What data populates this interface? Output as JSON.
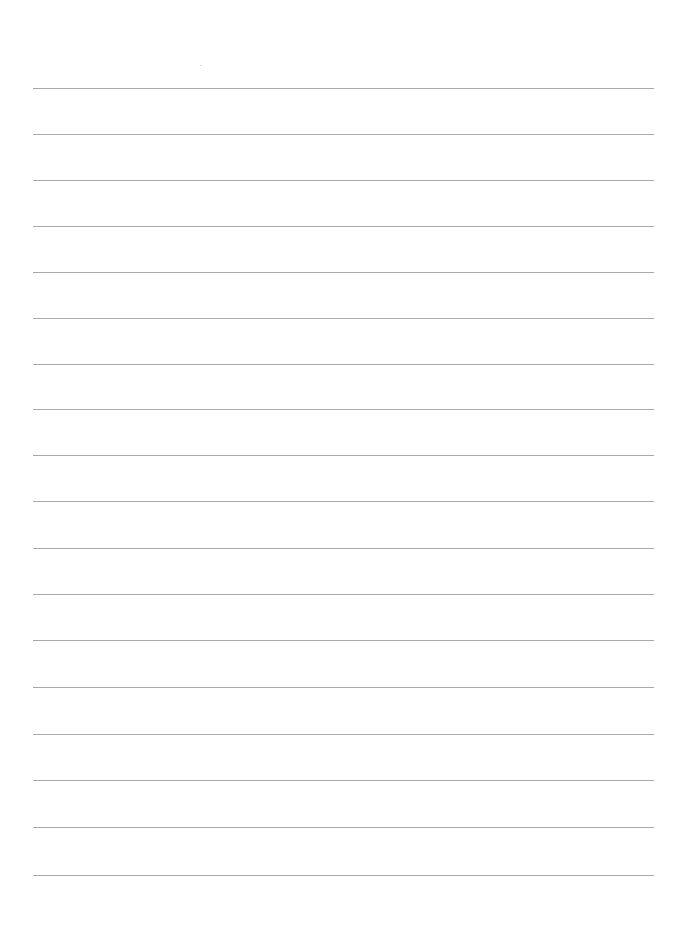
{
  "document": {
    "type": "blank lined paper",
    "line_count": 18,
    "line_color": "#a9a9a9",
    "background_color": "#ffffff",
    "lines_y": [
      88,
      134,
      180,
      226,
      272,
      318,
      364,
      409,
      455,
      501,
      548,
      594,
      640,
      687,
      734,
      780,
      827,
      875
    ],
    "line_left": 33,
    "line_width": 621
  }
}
